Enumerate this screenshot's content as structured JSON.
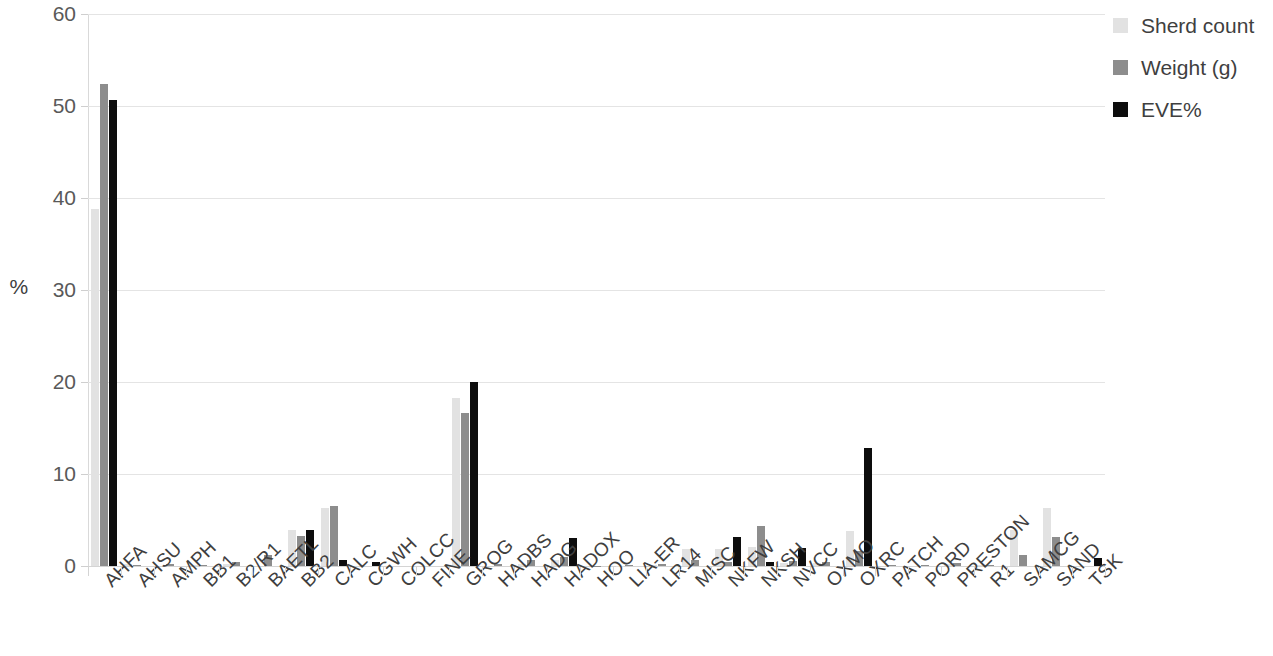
{
  "chart_data": {
    "type": "bar",
    "title": "",
    "xlabel": "",
    "ylabel": "%",
    "ylim": [
      0,
      60
    ],
    "yticks": [
      0,
      10,
      20,
      30,
      40,
      50,
      60
    ],
    "grid": true,
    "legend_position": "right",
    "categories": [
      "AHFA",
      "AHSU",
      "AMPH",
      "BB1",
      "B2/R1",
      "BAETL",
      "BB2",
      "CALC",
      "CGWH",
      "COLCC",
      "FINE",
      "GROG",
      "HADBS",
      "HADG",
      "HADOX",
      "HOO",
      "LIA-ER",
      "LR14",
      "MISC",
      "NKFW",
      "NKSH",
      "NVCC",
      "OXMO",
      "OXRC",
      "PATCH",
      "PORD",
      "PRESTON",
      "R1",
      "SAMCG",
      "SAND",
      "TSK"
    ],
    "series": [
      {
        "name": "Sherd count",
        "color": "#e2e2e2",
        "values": [
          38.8,
          0.2,
          0.0,
          0.1,
          0.25,
          0.0,
          3.9,
          6.3,
          0.0,
          0.0,
          0.0,
          18.3,
          0.0,
          0.2,
          0.7,
          0.0,
          0.05,
          0.15,
          1.9,
          1.9,
          2.1,
          0.3,
          0.35,
          3.8,
          0.0,
          0.0,
          0.2,
          0.1,
          3.9,
          6.3,
          0.0
        ]
      },
      {
        "name": "Weight (g)",
        "color": "#8d8d8d",
        "values": [
          52.4,
          0.15,
          0.25,
          0.1,
          0.4,
          1.2,
          3.3,
          6.5,
          0.0,
          0.0,
          0.0,
          16.6,
          0.2,
          0.6,
          1.0,
          0.05,
          0.1,
          0.25,
          0.6,
          0.4,
          4.3,
          0.5,
          0.4,
          1.6,
          0.15,
          0.1,
          0.3,
          0.1,
          1.2,
          3.2,
          0.0
        ]
      },
      {
        "name": "EVE%",
        "color": "#0d0d0d",
        "values": [
          50.6,
          0.0,
          0.0,
          0.0,
          0.0,
          0.0,
          3.9,
          0.7,
          0.4,
          0.0,
          0.0,
          20.0,
          0.0,
          0.0,
          3.0,
          0.0,
          0.0,
          0.0,
          0.0,
          3.1,
          0.4,
          2.0,
          0.0,
          12.8,
          0.0,
          0.0,
          0.0,
          0.0,
          0.0,
          0.0,
          0.9
        ]
      }
    ]
  },
  "legend": {
    "items": [
      {
        "label": "Sherd count",
        "color": "#e2e2e2"
      },
      {
        "label": "Weight (g)",
        "color": "#8d8d8d"
      },
      {
        "label": "EVE%",
        "color": "#0d0d0d"
      }
    ]
  },
  "axis": {
    "y_title": "%"
  }
}
